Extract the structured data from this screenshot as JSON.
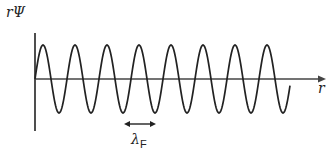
{
  "diagram": {
    "y_axis_label": "rΨ",
    "x_axis_label": "r",
    "wavelength_symbol": "λ",
    "wavelength_subscript": "F",
    "wave": {
      "type": "sinusoid",
      "cycles_shown": 8,
      "period_px": 32,
      "amplitude_px": 34,
      "start_x": 35,
      "end_x": 290,
      "axis_y": 79
    },
    "colors": {
      "line": "#222222",
      "background": "#ffffff"
    }
  }
}
